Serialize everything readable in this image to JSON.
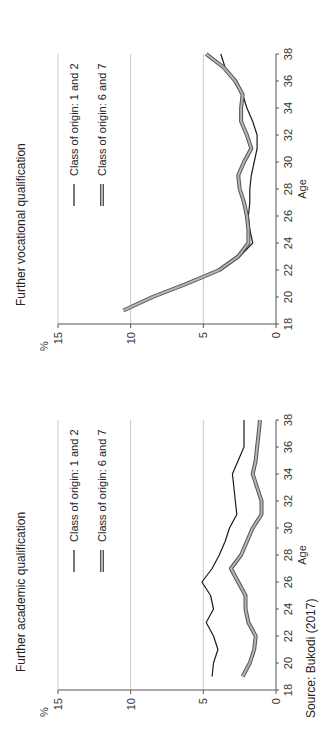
{
  "source": "Source: Bukodi (2017)",
  "chart_data": [
    {
      "type": "line",
      "title": "Further academic qualification",
      "xlabel": "Age",
      "ylabel": "%",
      "xlim": [
        18,
        38
      ],
      "ylim": [
        0,
        15
      ],
      "x_ticks": [
        18,
        20,
        22,
        24,
        26,
        28,
        30,
        32,
        34,
        36,
        38
      ],
      "y_ticks": [
        0,
        5,
        10,
        15
      ],
      "grid": "horizontal",
      "legend_position": "upper right inside",
      "x": [
        19,
        20,
        21,
        22,
        23,
        24,
        25,
        26,
        27,
        28,
        29,
        30,
        31,
        32,
        33,
        34,
        35,
        36,
        37,
        38
      ],
      "series": [
        {
          "name": "Class of origin: 1 and 2",
          "color": "#1a1a1a",
          "style": "thin solid",
          "values": [
            4.4,
            4.3,
            4.0,
            4.3,
            4.8,
            4.3,
            4.5,
            5.1,
            4.4,
            3.9,
            3.5,
            3.2,
            2.7,
            2.8,
            2.9,
            3.0,
            2.6,
            2.2,
            2.2,
            2.2
          ]
        },
        {
          "name": "Class of origin: 6 and 7",
          "color": "#8a8a8a",
          "style": "thick double",
          "values": [
            2.3,
            1.8,
            1.5,
            1.4,
            1.9,
            2.1,
            2.1,
            2.6,
            3.1,
            2.4,
            2.0,
            1.6,
            1.0,
            1.0,
            1.3,
            1.6,
            1.4,
            1.3,
            1.2,
            1.1
          ]
        }
      ]
    },
    {
      "type": "line",
      "title": "Further vocational qualification",
      "xlabel": "Age",
      "ylabel": "%",
      "xlim": [
        18,
        38
      ],
      "ylim": [
        0,
        15
      ],
      "x_ticks": [
        18,
        20,
        22,
        24,
        26,
        28,
        30,
        32,
        34,
        36,
        38
      ],
      "y_ticks": [
        0,
        5,
        10,
        15
      ],
      "grid": "horizontal",
      "legend_position": "upper right inside",
      "x": [
        19,
        20,
        21,
        22,
        23,
        24,
        25,
        26,
        27,
        28,
        29,
        30,
        31,
        32,
        33,
        34,
        35,
        36,
        37,
        38
      ],
      "series": [
        {
          "name": "Class of origin: 1 and 2",
          "color": "#1a1a1a",
          "style": "thin solid",
          "values": [
            10.4,
            8.6,
            6.3,
            4.0,
            2.5,
            1.6,
            1.8,
            1.9,
            1.8,
            1.8,
            1.7,
            1.5,
            1.3,
            1.3,
            1.6,
            2.0,
            2.3,
            2.7,
            3.5,
            3.8
          ]
        },
        {
          "name": "Class of origin: 6 and 7",
          "color": "#8a8a8a",
          "style": "thick double",
          "values": [
            10.5,
            8.5,
            6.1,
            3.9,
            2.6,
            1.9,
            1.9,
            2.0,
            2.2,
            2.5,
            2.6,
            2.2,
            1.7,
            2.0,
            2.4,
            2.4,
            2.3,
            2.8,
            3.6,
            4.8
          ]
        }
      ]
    }
  ]
}
